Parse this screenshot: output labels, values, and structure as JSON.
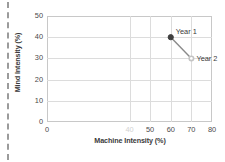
{
  "chart_data": {
    "type": "scatter",
    "title": "",
    "xlabel": "Machine Intensity (%)",
    "ylabel": "Mind Intensity (%)",
    "xlim": [
      0,
      80
    ],
    "ylim": [
      0,
      50
    ],
    "grid": true,
    "legend": "none",
    "xticks": [
      "0",
      "40",
      "50",
      "60",
      "70",
      "80"
    ],
    "xtick_values": [
      0,
      40,
      50,
      60,
      70,
      80
    ],
    "yticks": [
      "0",
      "10",
      "20",
      "30",
      "40",
      "50"
    ],
    "ytick_values": [
      0,
      10,
      20,
      30,
      40,
      50
    ],
    "series": [
      {
        "name": "Trend",
        "connected": true,
        "points": [
          {
            "label": "Year 1",
            "x": 60,
            "y": 40,
            "marker": "filled",
            "color": "#3f3f3f"
          },
          {
            "label": "Year 2",
            "x": 70,
            "y": 30,
            "marker": "open",
            "color": "#bfbfbf"
          }
        ]
      }
    ],
    "annotations": [
      {
        "text": "Year 1",
        "x": 60,
        "y": 40
      },
      {
        "text": "Year 2",
        "x": 70,
        "y": 30
      }
    ]
  },
  "axes": {
    "x_title": "Machine Intensity (%)",
    "y_title": "Mind Intensity (%)",
    "x_tick_labels": [
      {
        "value": 0,
        "text": "0",
        "faded": false
      },
      {
        "value": 40,
        "text": "40",
        "faded": true
      },
      {
        "value": 50,
        "text": "50",
        "faded": false
      },
      {
        "value": 60,
        "text": "60",
        "faded": false
      },
      {
        "value": 70,
        "text": "70",
        "faded": false
      },
      {
        "value": 80,
        "text": "80",
        "faded": false
      }
    ],
    "y_tick_labels": [
      {
        "value": 50,
        "text": "50"
      },
      {
        "value": 40,
        "text": "40"
      },
      {
        "value": 30,
        "text": "30"
      },
      {
        "value": 20,
        "text": "20"
      },
      {
        "value": 10,
        "text": "10"
      },
      {
        "value": 0,
        "text": "0"
      }
    ]
  },
  "markers": {
    "year1_label": "Year 1",
    "year2_label": "Year 2"
  },
  "colors": {
    "frame": "#c8c8c8",
    "grid": "#dcdcdc",
    "line": "#8a8a8a",
    "marker_filled": "#3f3f3f",
    "marker_open": "#c4c4c4",
    "text": "#3a3a3a",
    "dashed_edge": "#9b9b9b"
  }
}
